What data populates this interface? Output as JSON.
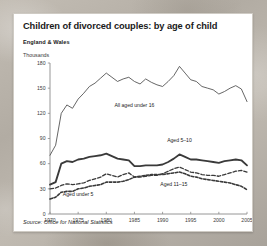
{
  "card": {
    "title": "Children of divorced couples: by age of child",
    "subtitle": "England & Wales",
    "source": "Source: Office for National Statistics"
  },
  "chart_data": {
    "type": "line",
    "title": "Children of divorced couples: by age of child",
    "subtitle": "England & Wales",
    "xlabel": "",
    "ylabel": "Thousands",
    "xlim": [
      1970,
      2005
    ],
    "ylim": [
      0,
      180
    ],
    "ytick_labels": [
      "0",
      "30",
      "60",
      "90",
      "120",
      "150",
      "180"
    ],
    "ytick_values": [
      0,
      30,
      60,
      90,
      120,
      150,
      180
    ],
    "xtick_labels": [
      "1970",
      "1975",
      "1980",
      "1985",
      "1990",
      "1995",
      "2000",
      "2005"
    ],
    "xtick_values": [
      1970,
      1975,
      1980,
      1985,
      1990,
      1995,
      2000,
      2005
    ],
    "grid": false,
    "legend": "inline-annotations",
    "x": [
      1970,
      1971,
      1972,
      1973,
      1974,
      1975,
      1976,
      1977,
      1978,
      1979,
      1980,
      1981,
      1982,
      1983,
      1984,
      1985,
      1986,
      1987,
      1988,
      1989,
      1990,
      1991,
      1992,
      1993,
      1994,
      1995,
      1996,
      1997,
      1998,
      1999,
      2000,
      2001,
      2002,
      2003,
      2004,
      2005
    ],
    "series": [
      {
        "name": "All aged under 16",
        "style": "thin-solid",
        "label": "All aged under 16",
        "values": [
          70,
          82,
          120,
          130,
          126,
          137,
          144,
          152,
          156,
          162,
          168,
          163,
          158,
          161,
          163,
          158,
          155,
          161,
          157,
          154,
          152,
          158,
          165,
          176,
          168,
          160,
          158,
          152,
          150,
          148,
          143,
          146,
          150,
          153,
          149,
          134
        ]
      },
      {
        "name": "Aged 5-10",
        "style": "thick-solid",
        "label": "Aged 5–10",
        "values": [
          35,
          38,
          60,
          63,
          62,
          65,
          66,
          68,
          69,
          70,
          72,
          69,
          66,
          65,
          64,
          57,
          57,
          58,
          58,
          58,
          59,
          62,
          66,
          71,
          68,
          65,
          65,
          64,
          63,
          62,
          61,
          63,
          64,
          65,
          64,
          58
        ]
      },
      {
        "name": "Aged 11-15",
        "style": "dashed-long",
        "label": "Aged 11–15",
        "values": [
          30,
          31,
          34,
          36,
          35,
          36,
          37,
          40,
          42,
          44,
          48,
          46,
          44,
          47,
          49,
          44,
          44,
          45,
          46,
          46,
          48,
          51,
          54,
          56,
          53,
          50,
          49,
          47,
          46,
          46,
          45,
          47,
          49,
          51,
          52,
          50
        ]
      },
      {
        "name": "Aged under 5",
        "style": "dashed-short",
        "label": "Aged under 5",
        "values": [
          18,
          20,
          26,
          27,
          27,
          30,
          31,
          33,
          34,
          35,
          38,
          38,
          38,
          39,
          41,
          44,
          45,
          46,
          47,
          47,
          47,
          48,
          49,
          50,
          48,
          45,
          44,
          42,
          41,
          40,
          39,
          38,
          37,
          35,
          33,
          29
        ]
      }
    ],
    "annotations": [
      {
        "text": "All aged under 16",
        "x": 1985,
        "y": 128
      },
      {
        "text": "Aged 5–10",
        "x": 1993,
        "y": 86
      },
      {
        "text": "Aged 11–15",
        "x": 1992,
        "y": 33
      },
      {
        "text": "Aged under 5",
        "x": 1975,
        "y": 22
      }
    ]
  },
  "colors": {
    "card_background": "#ffffff",
    "page_background": "#b9b4ab",
    "axis": "#8a8a8a",
    "line_under16": "#4a4a4a",
    "line_5_10": "#3a3a3a",
    "line_11_15": "#3a3a3a",
    "line_under5": "#3a3a3a",
    "text": "#1a1a1a"
  }
}
